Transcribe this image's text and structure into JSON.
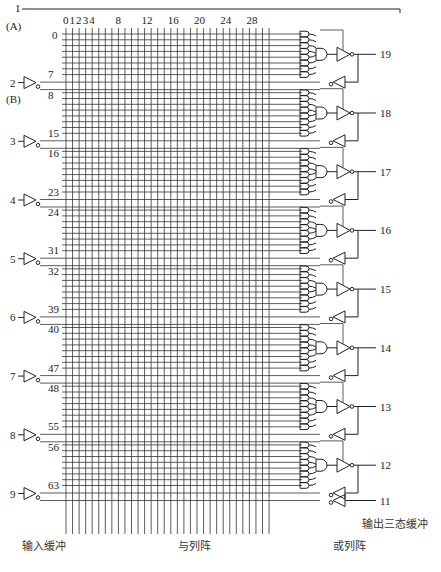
{
  "diagram": {
    "type": "GAL16V8 logic diagram",
    "input_pin_A": {
      "pin": "1",
      "alias": "(A)"
    },
    "input_pin_B_alias": "(B)",
    "column_labels": [
      "0",
      "1",
      "2",
      "3",
      "4",
      "8",
      "12",
      "16",
      "20",
      "24",
      "28"
    ],
    "column_label_positions": [
      0,
      1,
      2,
      3,
      4,
      8,
      12,
      16,
      20,
      24,
      28
    ],
    "column_count": 32,
    "input_buffers": [
      {
        "pin": "2",
        "row_top": "7",
        "row_bottom": "8"
      },
      {
        "pin": "3",
        "row_top": "15",
        "row_bottom": "16"
      },
      {
        "pin": "4",
        "row_top": "23",
        "row_bottom": "24"
      },
      {
        "pin": "5",
        "row_top": "31",
        "row_bottom": "32"
      },
      {
        "pin": "6",
        "row_top": "39",
        "row_bottom": "40"
      },
      {
        "pin": "7",
        "row_top": "47",
        "row_bottom": "48"
      },
      {
        "pin": "8",
        "row_top": "55",
        "row_bottom": "56"
      },
      {
        "pin": "9",
        "row_top": "63",
        "row_bottom": ""
      }
    ],
    "first_row_label": "0",
    "output_pins": [
      "19",
      "18",
      "17",
      "16",
      "15",
      "14",
      "13",
      "12"
    ],
    "last_input_pin": "11",
    "captions": {
      "input_buffer": "输入缓冲",
      "and_array": "与列阵",
      "or_array": "或列阵",
      "output_buffer": "输出三态缓冲"
    }
  }
}
